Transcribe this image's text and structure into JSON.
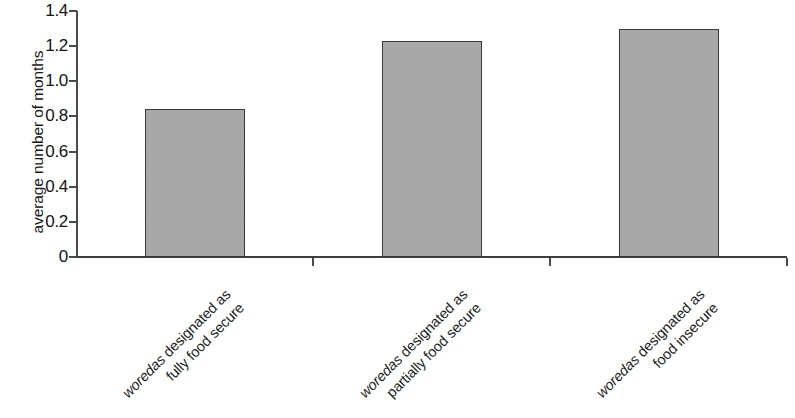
{
  "chart_data": {
    "type": "bar",
    "title": "",
    "subtitle": "",
    "xlabel": "",
    "ylabel": "average number of months",
    "ylim": [
      0,
      1.4
    ],
    "grid": false,
    "legend": false,
    "legend_position": "none",
    "categories": [
      "woredas designated as fully food secure",
      "woredas designated as partially food secure",
      "woredas designated as food insecure"
    ],
    "category_lines": [
      [
        "woredas designated as",
        "fully food secure"
      ],
      [
        "woredas designated as",
        "partially food secure"
      ],
      [
        "woredas designated as",
        "food insecure"
      ]
    ],
    "category_italic_word": "woredas",
    "values": [
      0.84,
      1.23,
      1.3
    ],
    "ytick_labels": [
      "0",
      "0.2",
      "0.4",
      "0.6",
      "0.8",
      "1.0",
      "1.2",
      "1.4"
    ],
    "ytick_values": [
      0,
      0.2,
      0.4,
      0.6,
      0.8,
      1.0,
      1.2,
      1.4
    ],
    "bar_fill_color": "#ababab",
    "bar_edge_color": "#3a3a3a",
    "axis_color": "#4a4a4a",
    "background_color": "#ffffff"
  },
  "axis": {
    "y_title": "average number of months"
  }
}
